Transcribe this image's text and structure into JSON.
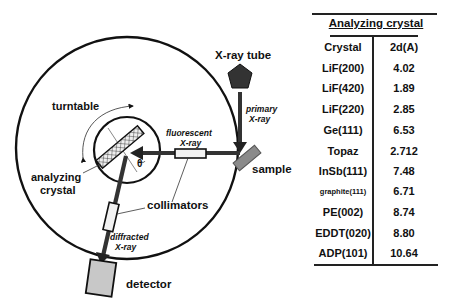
{
  "diagram": {
    "labels": {
      "xray_tube": "X-ray tube",
      "primary_xray_1": "primary",
      "primary_xray_2": "X-ray",
      "turntable": "turntable",
      "fluorescent_xray_1": "fluorescent",
      "fluorescent_xray_2": "X-ray",
      "sample": "sample",
      "theta": "θ",
      "analyzing_crystal_1": "analyzing",
      "analyzing_crystal_2": "crystal",
      "collimators": "collimators",
      "diffracted_xray_1": "diffracted",
      "diffracted_xray_2": "X-ray",
      "detector": "detector"
    },
    "colors": {
      "line": "#111111",
      "beam": "#333333",
      "tube": "#333333",
      "sample": "#8a8a8a",
      "detector": "#c8c8c8",
      "collimator": "#f2f2f2"
    }
  },
  "table": {
    "title": "Analyzing crystal",
    "headers": [
      "Crystal",
      "2d(A)"
    ],
    "rows": [
      {
        "crystal": "LiF(200)",
        "two_d": "4.02"
      },
      {
        "crystal": "LiF(420)",
        "two_d": "1.89"
      },
      {
        "crystal": "LiF(220)",
        "two_d": "2.85"
      },
      {
        "crystal": "Ge(111)",
        "two_d": "6.53"
      },
      {
        "crystal": "Topaz",
        "two_d": "2.712"
      },
      {
        "crystal": "InSb(111)",
        "two_d": "7.48"
      },
      {
        "crystal": "graphite(111)",
        "two_d": "6.71"
      },
      {
        "crystal": "PE(002)",
        "two_d": "8.74"
      },
      {
        "crystal": "EDDT(020)",
        "two_d": "8.80"
      },
      {
        "crystal": "ADP(101)",
        "two_d": "10.64"
      }
    ]
  }
}
